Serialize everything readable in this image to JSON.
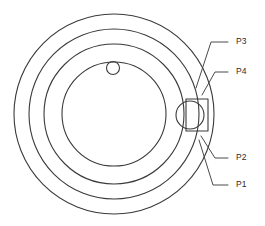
{
  "diagram": {
    "kind": "engineering-section-drawing",
    "background_color": "#ffffff",
    "line_color": "#3a3a3a",
    "text_color": "#2b2b2b",
    "canvas": {
      "width": 265,
      "height": 226
    },
    "center": {
      "x": 114,
      "y": 114
    },
    "concentric_circles": [
      {
        "name": "outer-rim-circle",
        "radius": 100
      },
      {
        "name": "second-circle",
        "radius": 85
      },
      {
        "name": "third-circle",
        "radius": 70
      },
      {
        "name": "inner-bore-circle",
        "radius": 52
      }
    ],
    "small_hole": {
      "name": "small-hole-circle",
      "cx": 113,
      "cy": 68,
      "radius": 6.5
    },
    "boss_feature": {
      "name": "side-boss",
      "circle": {
        "cx": 190,
        "cy": 115,
        "radius": 14
      },
      "rect": {
        "x": 186,
        "y": 99,
        "width": 22,
        "height": 32
      }
    },
    "callouts": [
      {
        "label": "P3",
        "text_x": 236,
        "text_y": 42,
        "dash_start_x": 228,
        "dash_end_x": 234,
        "leader": "M 228 42 L 211 42 L 196 88"
      },
      {
        "label": "P4",
        "text_x": 236,
        "text_y": 72,
        "dash_start_x": 228,
        "dash_end_x": 234,
        "leader": "M 228 72 L 215 72 L 202 95"
      },
      {
        "label": "P2",
        "text_x": 236,
        "text_y": 158,
        "dash_start_x": 228,
        "dash_end_x": 234,
        "leader": "M 228 158 L 215 158 L 201 136"
      },
      {
        "label": "P1",
        "text_x": 236,
        "text_y": 185,
        "dash_start_x": 228,
        "dash_end_x": 234,
        "leader": "M 228 185 L 213 185 L 199 140"
      }
    ]
  }
}
